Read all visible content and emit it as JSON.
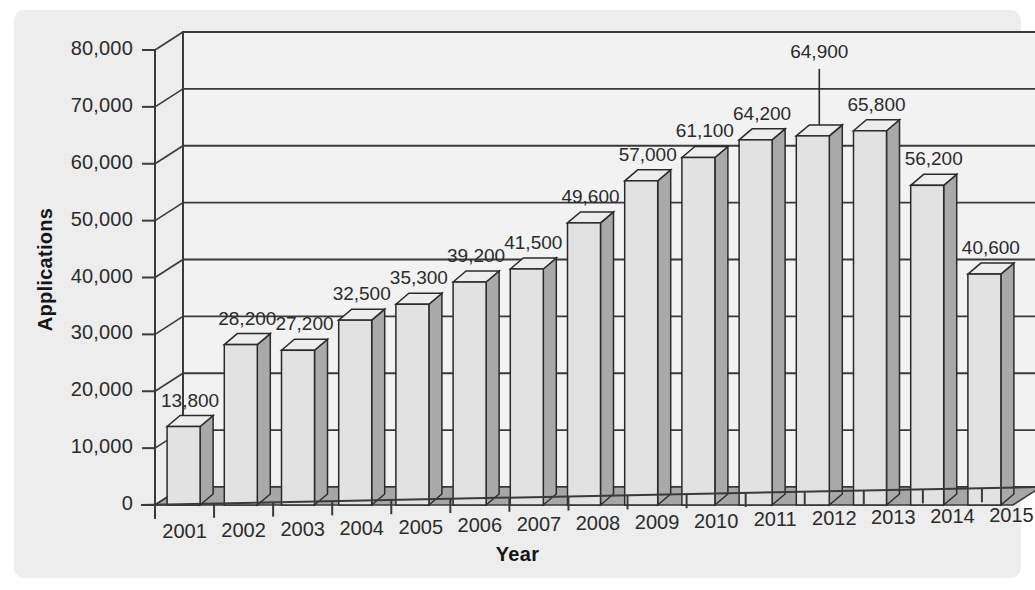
{
  "chart_data": {
    "type": "bar",
    "title": "",
    "xlabel": "Year",
    "ylabel": "Applications",
    "categories": [
      "2001",
      "2002",
      "2003",
      "2004",
      "2005",
      "2006",
      "2007",
      "2008",
      "2009",
      "2010",
      "2011",
      "2012",
      "2013",
      "2014",
      "2015"
    ],
    "values": [
      13800,
      28200,
      27200,
      32500,
      35300,
      39200,
      41500,
      49600,
      57000,
      61100,
      64200,
      64900,
      65800,
      56200,
      40600
    ],
    "value_labels": [
      "13,800",
      "28,200",
      "27,200",
      "32,500",
      "35,300",
      "39,200",
      "41,500",
      "49,600",
      "57,000",
      "61,100",
      "64,200",
      "64,900",
      "65,800",
      "56,200",
      "40,600"
    ],
    "ylim": [
      0,
      80000
    ],
    "ytick_values": [
      0,
      10000,
      20000,
      30000,
      40000,
      50000,
      60000,
      70000,
      80000
    ],
    "ytick_labels": [
      "0",
      "10,000",
      "20,000",
      "30,000",
      "40,000",
      "50,000",
      "60,000",
      "70,000",
      "80,000"
    ],
    "grid": true,
    "legend": false,
    "legend_position": "none",
    "style_3d": true,
    "annotations": [
      {
        "category": "2012",
        "label": "64,900",
        "leader_line": true
      }
    ],
    "colors": {
      "bar_front": "#e2e2e2",
      "bar_side": "#a9a9a9",
      "bar_top": "#ededed",
      "bar_outline": "#2b2b2b",
      "floor": "#a6a6a6",
      "wall": "#f2f2f2",
      "gridline": "#3a3a3a",
      "panel": "#f0f0f0",
      "text": "#2b2b2b"
    }
  }
}
